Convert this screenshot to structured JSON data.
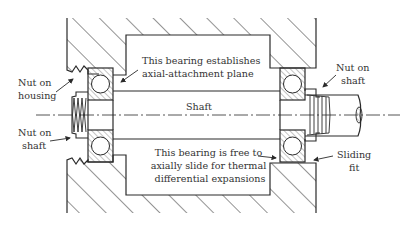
{
  "figure": {
    "type": "mechanical cross-section",
    "colors": {
      "line": "#2a2a2a",
      "text": "#333333",
      "background": "#ffffff"
    }
  },
  "labels": {
    "nut_on_housing": [
      "Nut on",
      "housing"
    ],
    "nut_on_shaft_left": [
      "Nut on",
      "shaft"
    ],
    "nut_on_shaft_right": [
      "Nut on",
      "shaft"
    ],
    "fixed_bearing": [
      "This bearing establishes",
      "axial-attachment plane"
    ],
    "shaft": "Shaft",
    "floating_bearing": [
      "This bearing is free to",
      "axially slide for thermal",
      "differential expansions"
    ],
    "sliding_fit": [
      "Sliding",
      "fit"
    ]
  }
}
